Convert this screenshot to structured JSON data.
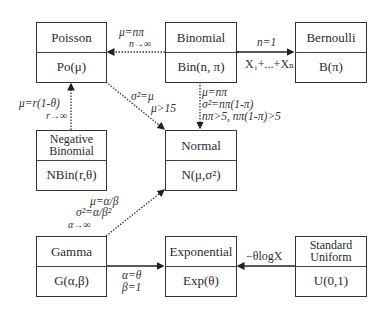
{
  "nodes": {
    "poisson": {
      "name": "Poisson",
      "notation": "Po(μ)"
    },
    "binomial": {
      "name": "Binomial",
      "notation": "Bin(n, π)"
    },
    "bernoulli": {
      "name": "Bernoulli",
      "notation": "B(π)"
    },
    "negative_binomial": {
      "name_line1": "Negative",
      "name_line2": "Binomial",
      "notation": "NBin(r,θ)"
    },
    "normal": {
      "name": "Normal",
      "notation": "N(μ,σ²)"
    },
    "gamma": {
      "name": "Gamma",
      "notation": "G(α,β)"
    },
    "exponential": {
      "name": "Exponential",
      "notation": "Exp(θ)"
    },
    "standard_uniform": {
      "name_line1": "Standard",
      "name_line2": "Uniform",
      "notation": "U(0,1)"
    }
  },
  "edges": {
    "binomial_to_poisson": {
      "line1": "μ=nπ",
      "line2": "n→∞",
      "style": "dotted"
    },
    "bernoulli_binomial": {
      "above": "n=1",
      "below": "X₁+...+Xₙ",
      "style": "solid",
      "direction": "both"
    },
    "negbin_to_poisson": {
      "line1": "μ=r(1-θ)",
      "line2": "r→∞",
      "style": "dotted"
    },
    "poisson_to_normal": {
      "line1": "σ²=μ",
      "line2": "μ>15",
      "style": "dotted"
    },
    "binomial_to_normal": {
      "line1": "μ=nπ",
      "line2": "σ²=nπ(1-π)",
      "line3": "nπ>5, nπ(1-π)>5",
      "style": "dotted"
    },
    "gamma_to_normal": {
      "line1": "μ=α/β",
      "line2": "σ²=α/β²",
      "line3": "α→∞",
      "style": "dotted"
    },
    "gamma_to_exponential": {
      "line1": "α=θ",
      "line2": "β=1",
      "style": "solid"
    },
    "uniform_to_exponential": {
      "line1": "−θlogX",
      "style": "solid"
    }
  }
}
